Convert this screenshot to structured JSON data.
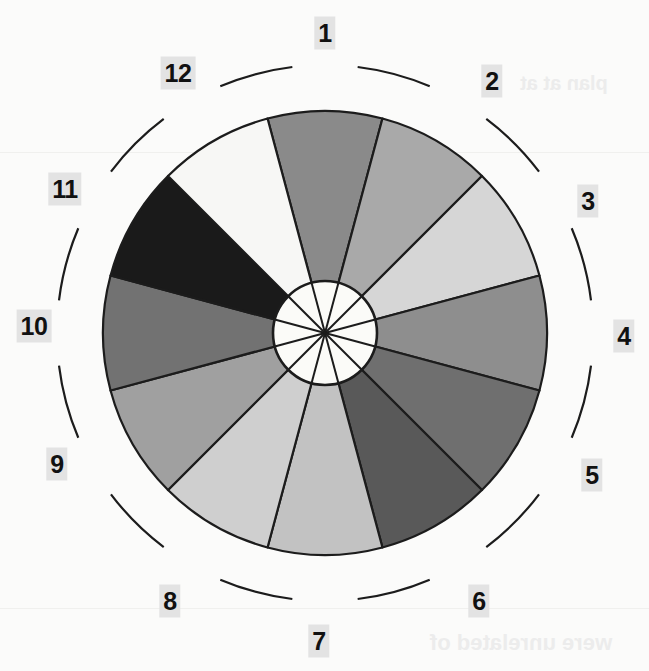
{
  "figure": {
    "title": "",
    "type": "wheel-diagram",
    "background_color": "#fbfbfa",
    "center": {
      "x": 325,
      "y": 333
    },
    "pie_radius": 222,
    "hub_radius": 52,
    "outer_ring_radius": 268,
    "stroke_color": "#1c1c1c",
    "hub_fill": "#fbfbf8"
  },
  "ghost_text": [
    {
      "text": "plan at at",
      "x": 520,
      "y": 72,
      "size": 20
    },
    {
      "text": "were unrelated of",
      "x": 430,
      "y": 630,
      "size": 22
    }
  ],
  "chart_data": {
    "type": "pie",
    "title": "",
    "xlabel": "",
    "ylabel": "",
    "legend_position": "outer-ring",
    "grid": false,
    "categories": [
      "1",
      "2",
      "3",
      "4",
      "5",
      "6",
      "7",
      "8",
      "9",
      "10",
      "11",
      "12"
    ],
    "values": [
      30,
      30,
      30,
      30,
      30,
      30,
      30,
      30,
      30,
      30,
      30,
      30
    ],
    "units": "degrees",
    "start_angle_deg": -15,
    "direction": "clockwise",
    "segments": [
      {
        "label": "1",
        "value": 30,
        "color": "#8a8a8a",
        "start_deg": -15,
        "end_deg": 15
      },
      {
        "label": "2",
        "value": 30,
        "color": "#a9a9a9",
        "start_deg": 15,
        "end_deg": 45
      },
      {
        "label": "3",
        "value": 30,
        "color": "#d6d6d6",
        "start_deg": 45,
        "end_deg": 75
      },
      {
        "label": "4",
        "value": 30,
        "color": "#8e8e8e",
        "start_deg": 75,
        "end_deg": 105
      },
      {
        "label": "5",
        "value": 30,
        "color": "#6f6f6f",
        "start_deg": 105,
        "end_deg": 135
      },
      {
        "label": "6",
        "value": 30,
        "color": "#595959",
        "start_deg": 135,
        "end_deg": 165
      },
      {
        "label": "7",
        "value": 30,
        "color": "#c2c2c2",
        "start_deg": 165,
        "end_deg": 195
      },
      {
        "label": "8",
        "value": 30,
        "color": "#cfcfcf",
        "start_deg": 195,
        "end_deg": 225
      },
      {
        "label": "9",
        "value": 30,
        "color": "#a0a0a0",
        "start_deg": 225,
        "end_deg": 255
      },
      {
        "label": "10",
        "value": 30,
        "color": "#727272",
        "start_deg": 255,
        "end_deg": 285
      },
      {
        "label": "11",
        "value": 30,
        "color": "#1a1a1a",
        "start_deg": 285,
        "end_deg": 315
      },
      {
        "label": "12",
        "value": 30,
        "color": "#f7f7f5",
        "start_deg": 315,
        "end_deg": 345
      }
    ]
  },
  "tick_labels": [
    {
      "text": "1",
      "x": 325,
      "y": 33,
      "angle_deg": 0
    },
    {
      "text": "2",
      "x": 492,
      "y": 81,
      "angle_deg": 30
    },
    {
      "text": "3",
      "x": 588,
      "y": 201,
      "angle_deg": 60
    },
    {
      "text": "4",
      "x": 624,
      "y": 336,
      "angle_deg": 90
    },
    {
      "text": "5",
      "x": 592,
      "y": 475,
      "angle_deg": 120
    },
    {
      "text": "6",
      "x": 479,
      "y": 601,
      "angle_deg": 150
    },
    {
      "text": "7",
      "x": 319,
      "y": 641,
      "angle_deg": 180
    },
    {
      "text": "8",
      "x": 170,
      "y": 601,
      "angle_deg": 210
    },
    {
      "text": "9",
      "x": 57,
      "y": 464,
      "angle_deg": 240
    },
    {
      "text": "10",
      "x": 34,
      "y": 326,
      "angle_deg": 270
    },
    {
      "text": "11",
      "x": 65,
      "y": 189,
      "angle_deg": 300
    },
    {
      "text": "12",
      "x": 178,
      "y": 73,
      "angle_deg": 330
    }
  ]
}
